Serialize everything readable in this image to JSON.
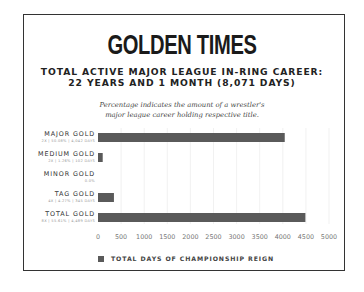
{
  "header": {
    "title": "GOLDEN TIMES",
    "subtitle_line1": "TOTAL ACTIVE MAJOR LEAGUE IN-RING CAREER:",
    "subtitle_line2": "22 YEARS AND 1 MONTH (8,071 DAYS)",
    "note_line1": "Percentage indicates the amount of a wrestler's",
    "note_line2": "major league career holding respective title."
  },
  "colors": {
    "bar": "#5a5a5a",
    "grid": "#eeeeee",
    "frame": "#333333"
  },
  "chart_data": {
    "type": "bar",
    "orientation": "horizontal",
    "title": "GOLDEN TIMES",
    "subtitle": "TOTAL ACTIVE MAJOR LEAGUE IN-RING CAREER: 22 YEARS AND 1 MONTH (8,071 DAYS)",
    "xlabel": "",
    "ylabel": "",
    "categories": [
      "MAJOR GOLD",
      "MEDIUM GOLD",
      "MINOR GOLD",
      "TAG GOLD",
      "TOTAL GOLD"
    ],
    "category_details": [
      "2X | 50.08% | 4,042 DAYS",
      "2X | 1.26% | 102 DAYS",
      "0.0%",
      "4X | 4.27% | 345 DAYS",
      "8X | 55.61% | 4,489 DAYS"
    ],
    "series": [
      {
        "name": "TOTAL DAYS OF CHAMPIONSHIP REIGN",
        "values": [
          4042,
          102,
          0,
          345,
          4489
        ]
      }
    ],
    "xlim": [
      0,
      5000
    ],
    "xticks": [
      0,
      500,
      1000,
      1500,
      2000,
      2500,
      3000,
      3500,
      4000,
      4500,
      5000
    ],
    "grid": true,
    "legend": {
      "position": "bottom-left",
      "entries": [
        "TOTAL DAYS OF CHAMPIONSHIP REIGN"
      ]
    }
  }
}
